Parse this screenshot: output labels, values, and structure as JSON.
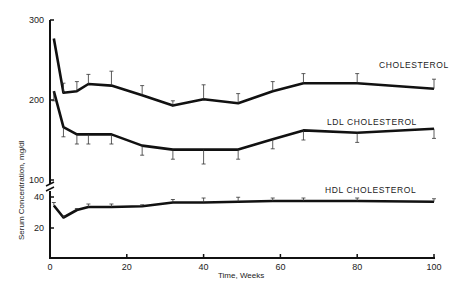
{
  "chart_data": {
    "type": "line",
    "title": "",
    "xlabel": "Time, Weeks",
    "ylabel": "Serum Concentration, mg/dl",
    "x_ticks": [
      0,
      20,
      40,
      60,
      80,
      100
    ],
    "y_ticks_upper": [
      100,
      200,
      300
    ],
    "y_ticks_lower": [
      20,
      40
    ],
    "axis_break": "between 40 and 100",
    "xlim": [
      0,
      100
    ],
    "grid": false,
    "legend": "inline labels",
    "x": [
      1,
      3.5,
      7,
      10,
      16,
      24,
      32,
      40,
      49,
      58,
      66,
      80,
      100
    ],
    "series": [
      {
        "name": "CHOLESTEROL",
        "values": [
          277,
          209,
          211,
          220,
          218,
          206,
          193,
          201,
          196,
          211,
          221,
          221,
          214
        ]
      },
      {
        "name": "LDL CHOLESTEROL",
        "values": [
          211,
          166,
          157,
          157,
          157,
          143,
          138,
          138,
          138,
          151,
          162,
          159,
          164
        ]
      },
      {
        "name": "HDL CHOLESTEROL",
        "values": [
          35,
          27,
          32,
          34,
          34,
          34.5,
          37,
          37,
          37.5,
          38,
          38,
          38,
          37.5
        ]
      }
    ],
    "error_bars": {
      "CHOLESTEROL": [
        0,
        12,
        12,
        12,
        18,
        12,
        6,
        18,
        12,
        12,
        12,
        12,
        12
      ],
      "LDL CHOLESTEROL": [
        12,
        12,
        12,
        12,
        12,
        12,
        12,
        18,
        12,
        12,
        12,
        12,
        12
      ],
      "HDL CHOLESTEROL": [
        2,
        1,
        1,
        2,
        2,
        1,
        2,
        3,
        3,
        2,
        2,
        2,
        2
      ]
    }
  },
  "labels": {
    "cholesterol": "CHOLESTEROL",
    "ldl": "LDL CHOLESTEROL",
    "hdl": "HDL CHOLESTEROL",
    "xlabel": "Time, Weeks",
    "ylabel": "Serum Concentration, mg/dl",
    "x_ticks": [
      "0",
      "20",
      "40",
      "60",
      "80",
      "100"
    ],
    "y_upper": [
      "300",
      "200",
      "100"
    ],
    "y_lower": [
      "40",
      "20"
    ]
  }
}
